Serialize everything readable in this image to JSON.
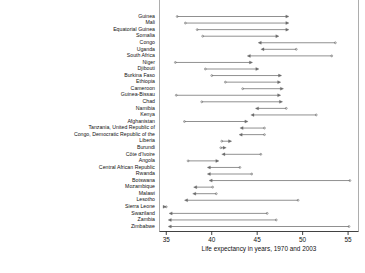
{
  "chart_data": {
    "type": "scatter",
    "title": "",
    "xlabel": "Life expectancy in years, 1970 and 2003",
    "ylabel": "",
    "xlim": [
      34.2,
      56.2
    ],
    "ticks": [
      35,
      40,
      45,
      50,
      55
    ],
    "tick_labels": [
      "35",
      "40",
      "45",
      "50",
      "55"
    ],
    "grid": false,
    "legend": "none",
    "series": [
      {
        "name": "1970"
      },
      {
        "name": "2003"
      }
    ],
    "note": "Arrow runs from the 1970 life expectancy (open dot) to the 2003 life expectancy (arrow head).",
    "categories": [
      "Guinea",
      "Mali",
      "Equatorial Guinea",
      "Somalia",
      "Congo",
      "Uganda",
      "South Africa",
      "Niger",
      "Djibouti",
      "Burkina Faso",
      "Ethiopia",
      "Cameroon",
      "Guinea-Bissau",
      "Chad",
      "Namibia",
      "Kenya",
      "Afghanistan",
      "Tanzania, United Republic of",
      "Congo, Democratic Republic of the",
      "Liberia",
      "Burundi",
      "Côte d'Ivoire",
      "Angola",
      "Central African Republic",
      "Rwanda",
      "Botswana",
      "Mozambique",
      "Malawi",
      "Lesotho",
      "Sierra Leone",
      "Swaziland",
      "Zambia",
      "Zimbabwe"
    ],
    "values_1970": [
      36.2,
      37.1,
      38.4,
      39.0,
      53.6,
      49.3,
      53.2,
      36.0,
      39.3,
      40.0,
      41.5,
      43.4,
      36.1,
      38.9,
      48.2,
      51.5,
      37.0,
      45.8,
      45.8,
      41.1,
      41.0,
      45.4,
      37.4,
      43.1,
      44.4,
      55.2,
      40.1,
      40.5,
      49.5,
      35.0,
      46.1,
      47.1,
      55.1
    ],
    "values_2003": [
      48.5,
      48.5,
      48.5,
      47.4,
      45.1,
      45.4,
      43.9,
      44.5,
      45.2,
      47.7,
      47.6,
      47.9,
      47.6,
      47.8,
      44.8,
      44.3,
      44.0,
      43.1,
      43.0,
      42.2,
      41.6,
      41.1,
      40.8,
      39.5,
      39.5,
      39.7,
      38.0,
      37.9,
      37.0,
      35.0,
      35.3,
      35.2,
      35.2
    ]
  },
  "axis": {
    "tick_labels": [
      "35",
      "40",
      "45",
      "50",
      "55"
    ],
    "xlabel": "Life expectancy in years, 1970 and 2003"
  }
}
